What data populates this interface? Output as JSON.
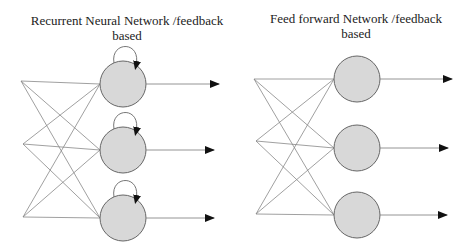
{
  "diagrams": [
    {
      "id": "rnn",
      "title_line1": "Recurrent Neural Network /feedback",
      "title_line2": "based",
      "has_self_loops": true,
      "inputs": [
        {
          "x": 21,
          "y": 81
        },
        {
          "x": 23,
          "y": 144
        },
        {
          "x": 23,
          "y": 217
        }
      ],
      "neurons": [
        {
          "x": 123,
          "y": 84,
          "r": 23
        },
        {
          "x": 123,
          "y": 150,
          "r": 23
        },
        {
          "x": 123,
          "y": 218,
          "r": 23
        }
      ],
      "outputs_end_x": [
        219,
        214,
        214
      ]
    },
    {
      "id": "ffn",
      "title_line1": "Feed forward Network /feedback",
      "title_line2": "based",
      "has_self_loops": false,
      "inputs": [
        {
          "x": 254,
          "y": 79
        },
        {
          "x": 256,
          "y": 141
        },
        {
          "x": 256,
          "y": 214
        }
      ],
      "neurons": [
        {
          "x": 357,
          "y": 79,
          "r": 23
        },
        {
          "x": 357,
          "y": 148,
          "r": 23
        },
        {
          "x": 357,
          "y": 215,
          "r": 23
        }
      ],
      "outputs_end_x": [
        452,
        448,
        447
      ]
    }
  ],
  "colors": {
    "neuron_fill": "#d8d8d8",
    "neuron_stroke": "#666666",
    "edge": "#888888",
    "arrow": "#111111",
    "text": "#222222"
  }
}
